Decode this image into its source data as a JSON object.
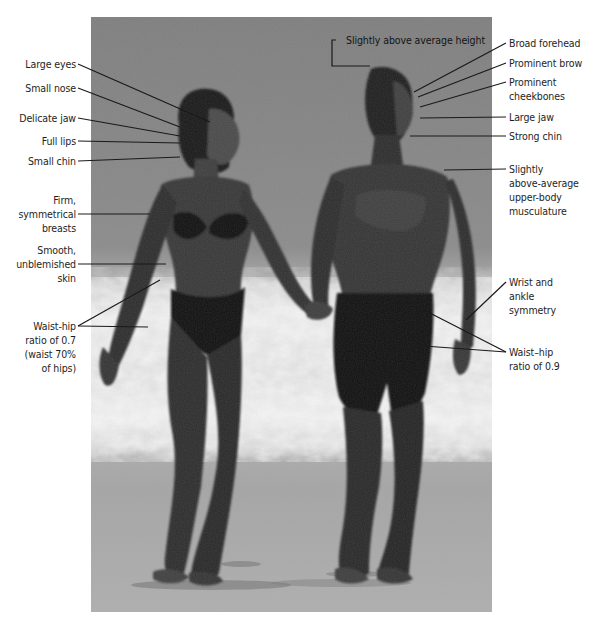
{
  "figure": {
    "colors": {
      "label_text": "#1e1e1e",
      "leader_line": "#1a1a1a",
      "background": "#ffffff"
    }
  },
  "labels": {
    "woman": [
      {
        "id": "large-eyes",
        "text": "Large eyes"
      },
      {
        "id": "small-nose",
        "text": "Small nose"
      },
      {
        "id": "delicate-jaw",
        "text": "Delicate jaw"
      },
      {
        "id": "full-lips",
        "text": "Full lips"
      },
      {
        "id": "small-chin",
        "text": "Small chin"
      },
      {
        "id": "firm-breasts",
        "text": "Firm,\nsymmetrical\nbreasts"
      },
      {
        "id": "smooth-skin",
        "text": "Smooth,\nunblemished\nskin"
      },
      {
        "id": "waist-hip-07",
        "text": "Waist-hip\nratio of 0.7\n(waist 70%\nof hips)"
      }
    ],
    "man": [
      {
        "id": "height",
        "text": "Slightly above average height"
      },
      {
        "id": "broad-forehead",
        "text": "Broad forehead"
      },
      {
        "id": "prominent-brow",
        "text": "Prominent brow"
      },
      {
        "id": "prominent-cheekbones",
        "text": "Prominent\ncheekbones"
      },
      {
        "id": "large-jaw",
        "text": "Large jaw"
      },
      {
        "id": "strong-chin",
        "text": "Strong chin"
      },
      {
        "id": "upper-body",
        "text": "Slightly\nabove-average\nupper-body\nmusculature"
      },
      {
        "id": "wrist-ankle",
        "text": "Wrist and\nankle\nsymmetry"
      },
      {
        "id": "waist-hip-09",
        "text": "Waist–hip\nratio of 0.9"
      }
    ]
  }
}
